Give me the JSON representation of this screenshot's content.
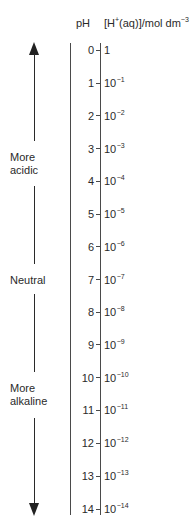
{
  "header": {
    "ph_label": "pH",
    "conc_label_base": "[H",
    "conc_label_plus": "+",
    "conc_label_mid": "(aq)]/mol dm",
    "conc_label_exp": "−3"
  },
  "side_labels": {
    "acidic_line1": "More",
    "acidic_line2": "acidic",
    "neutral": "Neutral",
    "alkaline_line1": "More",
    "alkaline_line2": "alkaline"
  },
  "arrow": {
    "direction_up": "more acidic",
    "direction_down": "more alkaline"
  },
  "scale": [
    {
      "ph": "0",
      "base": "1",
      "exp": ""
    },
    {
      "ph": "1",
      "base": "10",
      "exp": "−1"
    },
    {
      "ph": "2",
      "base": "10",
      "exp": "−2"
    },
    {
      "ph": "3",
      "base": "10",
      "exp": "−3"
    },
    {
      "ph": "4",
      "base": "10",
      "exp": "−4"
    },
    {
      "ph": "5",
      "base": "10",
      "exp": "−5"
    },
    {
      "ph": "6",
      "base": "10",
      "exp": "−6"
    },
    {
      "ph": "7",
      "base": "10",
      "exp": "−7"
    },
    {
      "ph": "8",
      "base": "10",
      "exp": "−8"
    },
    {
      "ph": "9",
      "base": "10",
      "exp": "−9"
    },
    {
      "ph": "10",
      "base": "10",
      "exp": "−10"
    },
    {
      "ph": "11",
      "base": "10",
      "exp": "−11"
    },
    {
      "ph": "12",
      "base": "10",
      "exp": "−12"
    },
    {
      "ph": "13",
      "base": "10",
      "exp": "−13"
    },
    {
      "ph": "14",
      "base": "10",
      "exp": "−14"
    }
  ],
  "colors": {
    "text": "#2a2a2a",
    "line": "#4a4a4a",
    "background": "#ffffff"
  }
}
